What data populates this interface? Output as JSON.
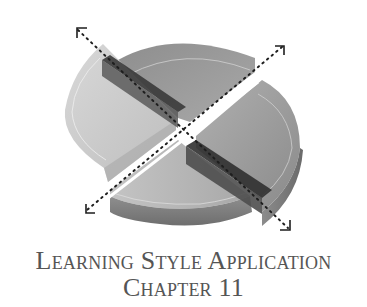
{
  "illustration": {
    "description": "3D disc divided into four quadrants by two crossing dotted double-arrow axes",
    "icons": [
      "quadrant-disc-icon",
      "dotted-axis-arrow-icon"
    ],
    "colors": {
      "light_quadrant": "#c9c9c9",
      "mid_quadrant": "#9a9a9a",
      "dark_bar": "#4a4a4a",
      "dots": "#2a2a2a"
    }
  },
  "caption": {
    "line1": "Learning Style Application",
    "line2": "Chapter 11",
    "color": "#555555"
  }
}
